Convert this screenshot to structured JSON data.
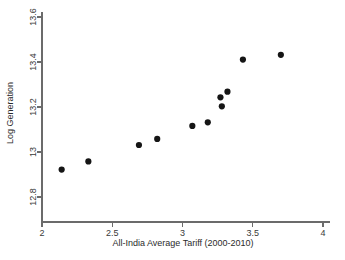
{
  "chart_data": {
    "type": "scatter",
    "title": "",
    "subtitle": "",
    "xlabel": "All-India Average Tariff (2000-2010)",
    "ylabel": "Log Generation",
    "xlim": [
      2,
      4
    ],
    "ylim": [
      12.8,
      13.6
    ],
    "xticks": [
      2,
      2.5,
      3,
      3.5,
      4
    ],
    "xticklabels": [
      "2",
      "2.5",
      "3",
      "3.5",
      "4"
    ],
    "yticks": [
      12.8,
      13.0,
      13.2,
      13.4,
      13.6
    ],
    "yticklabels": [
      "12.8",
      "13",
      "13.2",
      "13.4",
      "13.6"
    ],
    "grid": false,
    "legend": null,
    "legend_position": "none",
    "marker": "circle",
    "marker_color": "#151515",
    "marker_size": 3.1,
    "series": [
      {
        "name": "",
        "points": [
          {
            "x": 2.14,
            "y": 12.922
          },
          {
            "x": 2.33,
            "y": 12.958
          },
          {
            "x": 2.69,
            "y": 13.031
          },
          {
            "x": 2.82,
            "y": 13.058
          },
          {
            "x": 3.07,
            "y": 13.116
          },
          {
            "x": 3.18,
            "y": 13.132
          },
          {
            "x": 3.28,
            "y": 13.203
          },
          {
            "x": 3.27,
            "y": 13.243
          },
          {
            "x": 3.32,
            "y": 13.268
          },
          {
            "x": 3.43,
            "y": 13.411
          },
          {
            "x": 3.7,
            "y": 13.432
          }
        ]
      }
    ]
  },
  "colors": {
    "background": "#ffffff",
    "axis": "#6b6b6b",
    "text": "#2b2b2b",
    "marker": "#151515"
  }
}
